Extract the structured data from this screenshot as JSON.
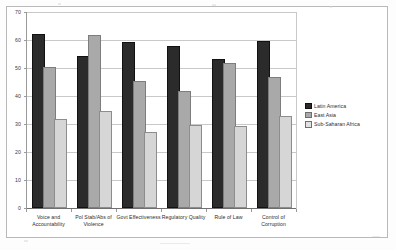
{
  "chart_data": {
    "type": "bar",
    "title": "",
    "xlabel": "",
    "ylabel": "",
    "ylim": [
      0,
      70
    ],
    "ytick_step": 10,
    "yticks": [
      "0",
      "10",
      "20",
      "30",
      "40",
      "50",
      "60",
      "70"
    ],
    "grid": true,
    "legend_position": "right",
    "categories": [
      "Voice and Accountability",
      "Pol Stab/Abs of Violence",
      "Govt Effectiveness",
      "Regulatory Quality",
      "Rule of Law",
      "Control of Corruption"
    ],
    "series": [
      {
        "name": "Latin America",
        "color": "#2b2b2b",
        "values": [
          61.5,
          53.5,
          58.5,
          57.0,
          52.5,
          59.0
        ]
      },
      {
        "name": "East Asia",
        "color": "#a9a9a9",
        "values": [
          49.5,
          61.0,
          44.5,
          41.0,
          51.0,
          46.0
        ]
      },
      {
        "name": "Sub-Saharan Africa",
        "color": "#d6d6d6",
        "values": [
          31.0,
          34.0,
          26.5,
          29.0,
          28.5,
          32.0
        ]
      }
    ]
  },
  "legend": {
    "items": [
      {
        "label": "Latin America"
      },
      {
        "label": "East Asia"
      },
      {
        "label": "Sub-Saharan Africa"
      }
    ]
  }
}
